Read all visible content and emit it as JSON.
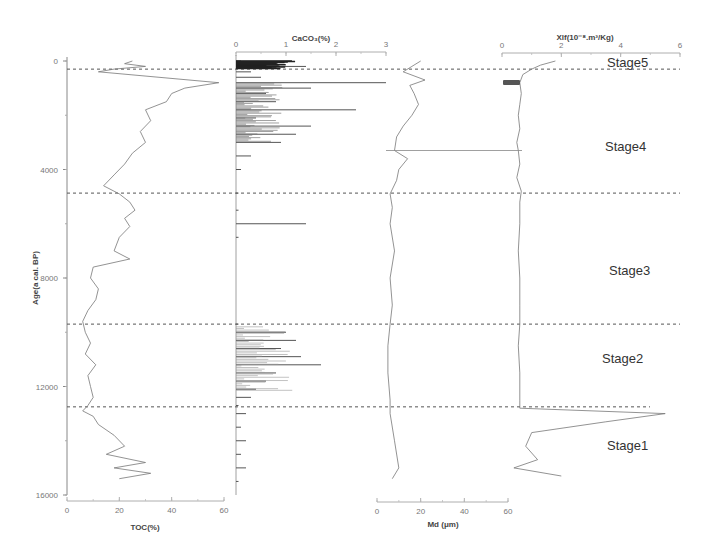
{
  "chart_data": {
    "type": "line",
    "title": "",
    "layout": "stratigraphic multi-panel plot (shared vertical age axis)",
    "y_axis": {
      "label": "Age(a cal. BP)",
      "range": [
        0,
        16000
      ],
      "inverted": true,
      "ticks": [
        0,
        4000,
        8000,
        12000,
        16000
      ]
    },
    "panels": [
      {
        "name": "TOC",
        "xlabel": "TOC(%)",
        "axis_position": "bottom",
        "xlim": [
          0,
          60
        ],
        "ticks": [
          0,
          20,
          40,
          60
        ],
        "series": {
          "age": [
            0,
            100,
            200,
            300,
            400,
            800,
            1000,
            1200,
            1500,
            1800,
            2200,
            2600,
            3000,
            3400,
            3800,
            4200,
            4600,
            4900,
            5200,
            5500,
            5800,
            6100,
            6500,
            7000,
            7300,
            7600,
            8000,
            8400,
            8800,
            9200,
            9600,
            10000,
            10400,
            10800,
            11200,
            11600,
            12000,
            12400,
            12700,
            12900,
            13100,
            13400,
            13800,
            14200,
            14500,
            14800,
            15000,
            15200,
            15400
          ],
          "value": [
            25,
            22,
            30,
            18,
            12,
            58,
            45,
            40,
            38,
            30,
            32,
            28,
            30,
            25,
            22,
            18,
            14,
            20,
            24,
            26,
            22,
            24,
            20,
            18,
            24,
            10,
            9,
            12,
            11,
            8,
            6,
            7,
            9,
            7,
            11,
            8,
            9,
            10,
            8,
            6,
            10,
            12,
            18,
            22,
            15,
            30,
            18,
            32,
            20
          ]
        }
      },
      {
        "name": "CaCO3",
        "xlabel": "CaCO₃(%)",
        "axis_position": "top",
        "xlim": [
          0,
          3
        ],
        "ticks": [
          0,
          1,
          2,
          3
        ],
        "series": {
          "age": [
            0,
            200,
            400,
            600,
            800,
            1000,
            1200,
            1500,
            1800,
            2100,
            2400,
            2700,
            3000,
            3500,
            4000,
            4870,
            5500,
            6000,
            6500,
            9700,
            10000,
            10300,
            10600,
            10900,
            11200,
            11500,
            11800,
            12100,
            12400,
            12700,
            13000,
            13500,
            14000,
            14500,
            15000,
            15500
          ],
          "value": [
            0.1,
            1.4,
            0.3,
            0.5,
            3.0,
            1.5,
            0.6,
            0.8,
            2.4,
            0.4,
            1.5,
            1.2,
            0.9,
            0.3,
            0.1,
            0.05,
            0.05,
            1.4,
            0.05,
            0.05,
            1.0,
            1.2,
            0.9,
            1.3,
            1.7,
            0.8,
            0.6,
            0.4,
            0.3,
            0.05,
            0.2,
            0.1,
            0.2,
            0.1,
            0.2,
            0.05
          ]
        }
      },
      {
        "name": "Md",
        "xlabel": "Md (μm)",
        "axis_position": "bottom",
        "xlim": [
          0,
          60
        ],
        "ticks": [
          0,
          20,
          40,
          60
        ],
        "series": {
          "age": [
            0,
            200,
            400,
            700,
            900,
            1200,
            1600,
            2000,
            2400,
            2800,
            3300,
            3600,
            4000,
            4400,
            4900,
            5400,
            6000,
            7000,
            8000,
            9000,
            9700,
            10500,
            11500,
            12500,
            13000,
            14000,
            15000,
            15400
          ],
          "value": [
            20,
            16,
            12,
            22,
            15,
            17,
            19,
            16,
            12,
            9,
            8,
            14,
            10,
            9,
            6,
            7,
            6,
            8,
            6,
            7,
            6,
            5,
            5,
            6,
            6,
            8,
            10,
            7
          ]
        }
      },
      {
        "name": "Xlf",
        "xlabel": "Xlf(10⁻⁸.m³/Kg)",
        "axis_position": "top",
        "xlim": [
          0,
          6
        ],
        "ticks": [
          0,
          2,
          4,
          6
        ],
        "series": {
          "age": [
            0,
            150,
            300,
            500,
            800,
            1200,
            1600,
            2000,
            2500,
            3000,
            3300,
            3800,
            4300,
            4800,
            5200,
            6000,
            7000,
            8000,
            9000,
            9700,
            10500,
            11500,
            12500,
            12800,
            13000,
            13300,
            13700,
            14200,
            14700,
            15000,
            15300
          ],
          "value": [
            1.8,
            1.3,
            1.0,
            0.7,
            0.6,
            0.65,
            0.6,
            0.55,
            0.6,
            0.5,
            0.55,
            0.6,
            0.5,
            0.65,
            0.6,
            0.6,
            0.55,
            0.6,
            0.6,
            0.6,
            0.55,
            0.6,
            0.6,
            0.6,
            5.5,
            3.5,
            1.0,
            0.8,
            1.2,
            0.4,
            2.0
          ]
        }
      }
    ],
    "stage_boundaries": [
      300,
      4870,
      9700,
      12750
    ],
    "stages": [
      {
        "label": "Stage5",
        "age_mid": 50
      },
      {
        "label": "Stage4",
        "age_mid": 3200
      },
      {
        "label": "Stage3",
        "age_mid": 7800
      },
      {
        "label": "Stage2",
        "age_mid": 11000
      },
      {
        "label": "Stage1",
        "age_mid": 14200
      }
    ],
    "grid": false,
    "legend": null
  },
  "labels": {
    "y_axis_title": "Age(a cal. BP)",
    "toc_title": "TOC(%)",
    "caco3_title": "CaCO₃(%)",
    "md_title": "Md (μm)",
    "xlf_title": "Xlf(10⁻⁸.m³/Kg)",
    "stage5": "Stage5",
    "stage4": "Stage4",
    "stage3": "Stage3",
    "stage2": "Stage2",
    "stage1": "Stage1"
  }
}
